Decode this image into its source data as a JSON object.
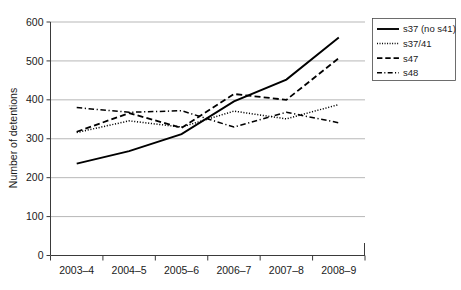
{
  "chart_data": {
    "type": "line",
    "title": "",
    "xlabel": "",
    "ylabel": "Number of detentions",
    "categories": [
      "2003–4",
      "2004–5",
      "2005–6",
      "2006–7",
      "2007–8",
      "2008–9"
    ],
    "ylim": [
      0,
      600
    ],
    "ytick_values": [
      0,
      100,
      200,
      300,
      400,
      500,
      600
    ],
    "ytick_labels": [
      "0",
      "100",
      "200",
      "300",
      "400",
      "500",
      "600"
    ],
    "grid": true,
    "legend_position": "top-right-outside",
    "series": [
      {
        "name": "s37 (no s41)",
        "style": "solid",
        "values": [
          236,
          268,
          312,
          396,
          452,
          560
        ]
      },
      {
        "name": "s37/41",
        "style": "dotted",
        "values": [
          316,
          346,
          330,
          371,
          351,
          388
        ]
      },
      {
        "name": "s47",
        "style": "dashed",
        "values": [
          318,
          366,
          328,
          415,
          400,
          507
        ]
      },
      {
        "name": "s48",
        "style": "dash-dot",
        "values": [
          380,
          368,
          372,
          330,
          368,
          341
        ]
      }
    ]
  },
  "legend": {
    "entries": [
      {
        "label": "s37 (no s41)",
        "style": "solid"
      },
      {
        "label": "s37/41",
        "style": "dotted"
      },
      {
        "label": "s47",
        "style": "dashed"
      },
      {
        "label": "s48",
        "style": "dash-dot"
      }
    ]
  },
  "colors": {
    "ink": "#000000",
    "grid": "#9a9a9a",
    "axis": "#3a3a3a",
    "background": "#ffffff"
  }
}
